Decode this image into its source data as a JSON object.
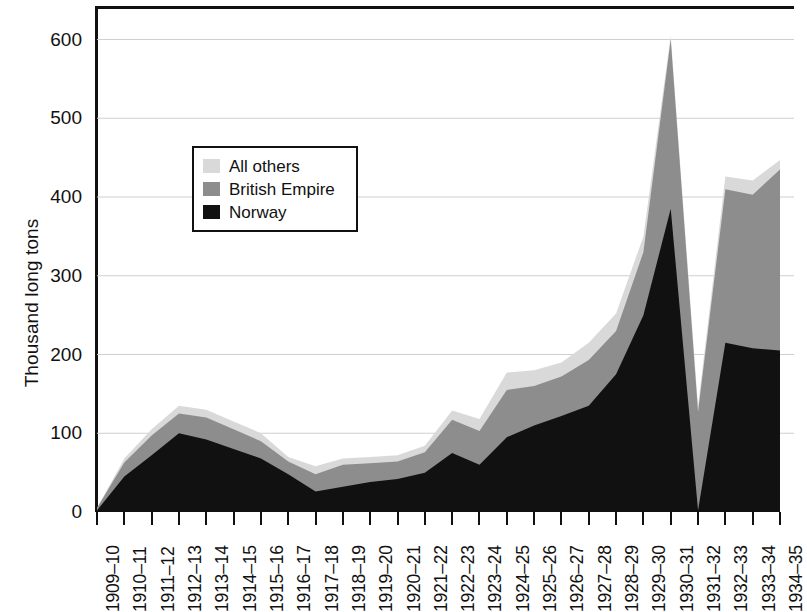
{
  "chart_data": {
    "type": "area",
    "stacked": true,
    "title": "",
    "subtitle": "",
    "xlabel": "",
    "ylabel": "Thousand long tons",
    "ylim": [
      0,
      640
    ],
    "yticks": [
      0,
      100,
      200,
      300,
      400,
      500,
      600
    ],
    "ytick_labels": [
      "0",
      "100",
      "200",
      "300",
      "400",
      "500",
      "600"
    ],
    "grid": true,
    "grid_axis": "y",
    "legend_position": "upper-left-inside",
    "categories": [
      "1909–10",
      "1910–11",
      "1911–12",
      "1912–13",
      "1913–14",
      "1914–15",
      "1915–16",
      "1916–17",
      "1917–18",
      "1918–19",
      "1919–20",
      "1920–21",
      "1921–22",
      "1922–23",
      "1923–24",
      "1924–25",
      "1925–26",
      "1926–27",
      "1927–28",
      "1928–29",
      "1929–30",
      "1930–31",
      "1931–32",
      "1932–33",
      "1933–34",
      "1934–35"
    ],
    "series": [
      {
        "name": "Norway",
        "color": "#111111",
        "values": [
          2,
          45,
          72,
          100,
          92,
          80,
          68,
          48,
          26,
          32,
          38,
          42,
          50,
          75,
          60,
          95,
          110,
          122,
          135,
          175,
          250,
          385,
          2,
          215,
          208,
          205
        ]
      },
      {
        "name": "British Empire",
        "color": "#8d8d8d",
        "values": [
          3,
          18,
          25,
          25,
          28,
          25,
          22,
          16,
          22,
          28,
          24,
          22,
          26,
          42,
          43,
          60,
          50,
          50,
          58,
          55,
          80,
          215,
          125,
          195,
          195,
          230
        ]
      },
      {
        "name": "All others",
        "color": "#d9d9d9",
        "values": [
          0,
          5,
          8,
          10,
          10,
          10,
          10,
          6,
          10,
          8,
          8,
          8,
          8,
          12,
          15,
          22,
          20,
          18,
          22,
          22,
          20,
          5,
          8,
          16,
          18,
          12
        ]
      }
    ],
    "stack_order_bottom_to_top": [
      "Norway",
      "British Empire",
      "All others"
    ],
    "totals": [
      5,
      68,
      105,
      135,
      130,
      115,
      100,
      70,
      58,
      68,
      70,
      72,
      84,
      129,
      118,
      177,
      180,
      190,
      215,
      252,
      350,
      605,
      135,
      426,
      421,
      447
    ]
  },
  "axes": {
    "y_title": "Thousand long tons",
    "y_tick_labels": [
      "600",
      "500",
      "400",
      "300",
      "200",
      "100",
      "0"
    ]
  },
  "legend": {
    "items": [
      {
        "label": "All others",
        "color": "#d9d9d9"
      },
      {
        "label": "British Empire",
        "color": "#8d8d8d"
      },
      {
        "label": "Norway",
        "color": "#111111"
      }
    ]
  },
  "colors": {
    "norway": "#111111",
    "british_empire": "#8d8d8d",
    "all_others": "#d9d9d9",
    "axis": "#111111",
    "grid": "#cfcfcf",
    "background": "#ffffff"
  }
}
